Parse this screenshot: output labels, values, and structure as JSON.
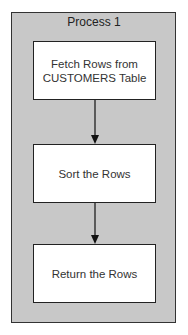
{
  "diagram": {
    "container_title": "Process 1",
    "steps": [
      {
        "label": "Fetch Rows from\nCUSTOMERS Table"
      },
      {
        "label": "Sort the Rows"
      },
      {
        "label": "Return the Rows"
      }
    ],
    "colors": {
      "container_fill": "#c8c8c8",
      "box_fill": "#ffffff",
      "stroke": "#222222"
    }
  }
}
